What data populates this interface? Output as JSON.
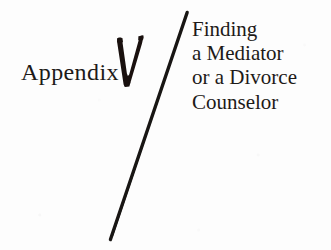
{
  "page": {
    "background_color": "#fdfdfd",
    "ink_color": "#1d1a18",
    "width": 331,
    "height": 250
  },
  "appendix": {
    "label": "Appendix",
    "number": "V",
    "number_icon": "bold-letter-v-glyph"
  },
  "divider": {
    "icon": "diagonal-slash-rule",
    "color": "#191614"
  },
  "title": {
    "lines": [
      "Finding",
      "a Mediator",
      "or a Divorce",
      "Counselor"
    ],
    "full_text": "Finding a Mediator or a Divorce Counselor"
  }
}
